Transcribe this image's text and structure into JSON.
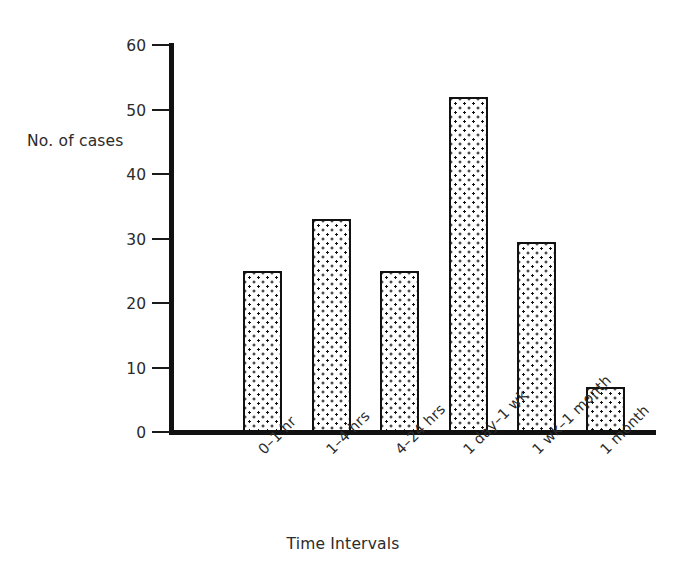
{
  "chart_data": {
    "type": "bar",
    "title": "",
    "xlabel": "Time Intervals",
    "ylabel": "No. of cases",
    "categories": [
      "0–1 hr",
      "1–4 hrs",
      "4–24 hrs",
      "1 day–1 wk",
      "1 wk–1 month",
      "1 month"
    ],
    "values": [
      25,
      33,
      25,
      52,
      29.5,
      7
    ],
    "ylim": [
      0,
      60
    ],
    "yticks": [
      0,
      10,
      20,
      30,
      40,
      50,
      60
    ],
    "ytick_labels": [
      "0",
      "10",
      "20",
      "30",
      "40",
      "50",
      "60"
    ],
    "grid": false,
    "legend": false,
    "bar_fill": "dotted-stipple",
    "bar_edge_color": "#111111",
    "bar_face_color": "#ffffff",
    "axis_color": "#111111",
    "text_color": "#2b2b2b",
    "background": "#ffffff"
  }
}
